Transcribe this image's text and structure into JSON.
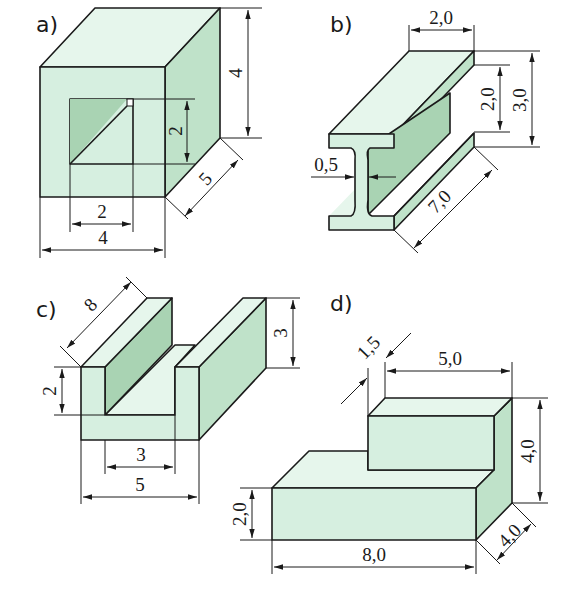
{
  "colors": {
    "front": "#d6efe0",
    "top": "#e6f6ec",
    "side": "#bfe2c9",
    "inner": "#a9d3b3",
    "line": "#1a1a1a"
  },
  "figures": [
    {
      "id": "a",
      "label": "a)",
      "shape": "box with square through-hole",
      "dimensions": {
        "width": "4",
        "height": "4",
        "depth": "5",
        "hole_width": "2",
        "hole_height": "2"
      }
    },
    {
      "id": "b",
      "label": "b)",
      "shape": "I-beam",
      "dimensions": {
        "flange_width": "2,0",
        "web_height": "2,0",
        "total_height": "3,0",
        "web_thickness": "0,5",
        "length": "7,0"
      }
    },
    {
      "id": "c",
      "label": "c)",
      "shape": "U-channel",
      "dimensions": {
        "length": "8",
        "height": "3",
        "groove_depth": "2",
        "groove_width": "3",
        "total_width": "5"
      }
    },
    {
      "id": "d",
      "label": "d)",
      "shape": "stepped block",
      "dimensions": {
        "offset": "1,5",
        "top_width": "5,0",
        "total_height": "4,0",
        "base_height": "2,0",
        "base_width": "8,0",
        "depth": "4,0"
      }
    }
  ]
}
